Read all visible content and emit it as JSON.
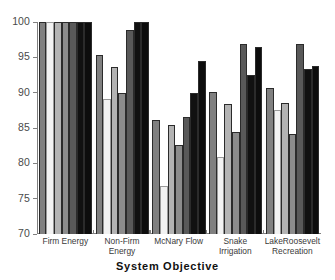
{
  "chart_data": {
    "type": "bar",
    "title": "",
    "subtitle": "",
    "xlabel": "System Objective",
    "ylabel": "",
    "ylim": [
      70,
      100
    ],
    "yticks": [
      70,
      75,
      80,
      85,
      90,
      95,
      100
    ],
    "ytick_labels": [
      "70",
      "75",
      "80",
      "85",
      "90",
      "95",
      "100"
    ],
    "grid": false,
    "legend": "none",
    "orientation": "vertical",
    "grouping": "grouped",
    "categories": [
      "Firm Energy",
      "Non-Firm Energy",
      "McNary Flow",
      "Snake Irrigation",
      "LakeRoosevelt Recreation"
    ],
    "series": [
      {
        "name": "Alternative 1",
        "color": "#808080",
        "values": [
          100.0,
          95.3,
          86.2,
          90.1,
          90.6
        ]
      },
      {
        "name": "Alternative 2",
        "color": "#f2f2f2",
        "values": [
          100.0,
          89.1,
          76.8,
          80.9,
          87.5
        ]
      },
      {
        "name": "Alternative 3",
        "color": "#b3b3b3",
        "values": [
          100.0,
          93.7,
          85.4,
          88.4,
          88.6
        ]
      },
      {
        "name": "Alternative 4",
        "color": "#8c8c8c",
        "values": [
          100.0,
          90.0,
          82.6,
          84.4,
          84.2
        ]
      },
      {
        "name": "Alternative 5",
        "color": "#595959",
        "values": [
          100.0,
          98.9,
          86.6,
          96.9,
          96.9
        ]
      },
      {
        "name": "Alternative 6",
        "color": "#111111",
        "values": [
          100.0,
          100.0,
          90.0,
          92.5,
          93.4
        ]
      },
      {
        "name": "Alternative 7",
        "color": "#0d0d0d",
        "values": [
          100.0,
          100.0,
          94.5,
          96.5,
          93.8
        ]
      }
    ]
  },
  "axis": {
    "y_axis_name": "percent-of-maximum",
    "x_axis_title": "System Objective"
  }
}
